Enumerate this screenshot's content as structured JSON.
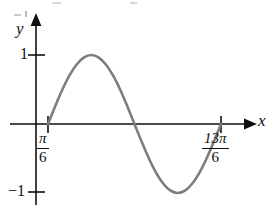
{
  "figure": {
    "background_color": "#ffffff",
    "width": 276,
    "height": 216,
    "axis_color": "#111111",
    "curve_color": "#7d7d7d"
  },
  "axes": {
    "y_axis_label": "y",
    "x_axis_label": "x",
    "y_origin_px": 124,
    "x_origin_px": 36,
    "y_tick_labels": [
      "1",
      "−1"
    ],
    "y_tick_values": [
      1,
      -1
    ],
    "x_tick_labels": [
      "π/6",
      "13π/6"
    ],
    "x_tick_values": [
      0.5235987756,
      6.8067840828
    ]
  },
  "y_tick_top": {
    "label": "1",
    "value": 1
  },
  "y_tick_bottom": {
    "label": "−1",
    "value": -1
  },
  "x_tick_left": {
    "numerator": "π",
    "denominator": "6",
    "label": "π/6",
    "value": 0.5235987756
  },
  "x_tick_right": {
    "numerator": "13π",
    "denominator": "6",
    "label": "13π/6",
    "value": 6.8067840828
  },
  "chart_data": {
    "type": "line",
    "title": "",
    "subtitle": "",
    "xlabel": "x",
    "ylabel": "y",
    "grid": false,
    "legend": null,
    "xlim": [
      0.5235987756,
      6.8067840828
    ],
    "ylim": [
      -1,
      1
    ],
    "xticks": [
      0.5235987756,
      6.8067840828
    ],
    "xticklabels": [
      "π/6",
      "13π/6"
    ],
    "yticks": [
      -1,
      1
    ],
    "yticklabels": [
      "1",
      "−1"
    ],
    "series": [
      {
        "name": "sine curve",
        "color": "#7d7d7d",
        "equation": "y = sin(x − π/6)",
        "domain": [
          "π/6",
          "13π/6"
        ],
        "period": "2π",
        "amplitude": 1,
        "key_points": [
          {
            "label": "start",
            "x": "π/6",
            "y": 0
          },
          {
            "label": "maximum",
            "x": "2π/3",
            "y": 1
          },
          {
            "label": "zero",
            "x": "7π/6",
            "y": 0
          },
          {
            "label": "minimum",
            "x": "5π/3",
            "y": -1
          },
          {
            "label": "end",
            "x": "13π/6",
            "y": 0
          }
        ],
        "x": [
          0.524,
          0.785,
          1.047,
          1.309,
          1.571,
          1.833,
          2.094,
          2.356,
          2.618,
          2.88,
          3.142,
          3.403,
          3.665,
          3.927,
          4.189,
          4.451,
          4.712,
          4.974,
          5.236,
          5.498,
          5.76,
          6.021,
          6.283,
          6.545,
          6.807
        ],
        "y": [
          0.0,
          0.259,
          0.5,
          0.707,
          0.866,
          0.966,
          1.0,
          0.966,
          0.866,
          0.707,
          0.5,
          0.259,
          0.0,
          -0.259,
          -0.5,
          -0.707,
          -0.866,
          -0.966,
          -1.0,
          -0.966,
          -0.866,
          -0.707,
          -0.5,
          -0.259,
          0.0
        ]
      }
    ]
  }
}
